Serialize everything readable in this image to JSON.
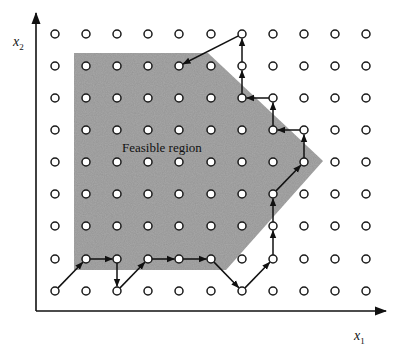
{
  "figure": {
    "region_label": "Feasible region",
    "x_axis_label": {
      "base": "x",
      "sub": "1"
    },
    "y_axis_label": {
      "base": "x",
      "sub": "2"
    }
  },
  "colors": {
    "background": "#ffffff",
    "region_fill": "#a9a9a9",
    "lattice_stroke": "#1a1a1a",
    "lattice_fill": "#ffffff",
    "axis": "#111111",
    "path": "#111111"
  },
  "grid": {
    "columns": [
      55,
      86,
      117,
      148,
      179,
      211,
      242,
      273,
      304,
      335,
      366
    ],
    "rows": [
      34,
      66,
      98,
      130,
      162,
      194,
      226,
      259,
      291
    ],
    "point_radius": 4
  },
  "axes": {
    "origin": [
      36,
      311
    ],
    "x_end": 386,
    "y_end": 13
  },
  "feasible_region": {
    "polygon": [
      [
        74,
        53
      ],
      [
        208,
        53
      ],
      [
        323,
        161
      ],
      [
        226,
        270
      ],
      [
        74,
        270
      ]
    ]
  },
  "search_path": [
    [
      [
        55,
        291
      ],
      [
        86,
        259
      ]
    ],
    [
      [
        86,
        259
      ],
      [
        117,
        259
      ]
    ],
    [
      [
        117,
        259
      ],
      [
        117,
        291
      ]
    ],
    [
      [
        117,
        291
      ],
      [
        148,
        259
      ]
    ],
    [
      [
        148,
        259
      ],
      [
        179,
        259
      ]
    ],
    [
      [
        179,
        259
      ],
      [
        211,
        259
      ]
    ],
    [
      [
        211,
        259
      ],
      [
        242,
        291
      ]
    ],
    [
      [
        242,
        291
      ],
      [
        273,
        259
      ]
    ],
    [
      [
        273,
        259
      ],
      [
        273,
        226
      ]
    ],
    [
      [
        273,
        226
      ],
      [
        273,
        194
      ]
    ],
    [
      [
        273,
        194
      ],
      [
        304,
        162
      ]
    ],
    [
      [
        304,
        162
      ],
      [
        304,
        130
      ]
    ],
    [
      [
        304,
        130
      ],
      [
        273,
        130
      ]
    ],
    [
      [
        273,
        130
      ],
      [
        273,
        98
      ]
    ],
    [
      [
        273,
        98
      ],
      [
        242,
        98
      ]
    ],
    [
      [
        242,
        98
      ],
      [
        242,
        66
      ]
    ],
    [
      [
        242,
        66
      ],
      [
        242,
        34
      ]
    ],
    [
      [
        242,
        34
      ],
      [
        179,
        66
      ]
    ]
  ]
}
